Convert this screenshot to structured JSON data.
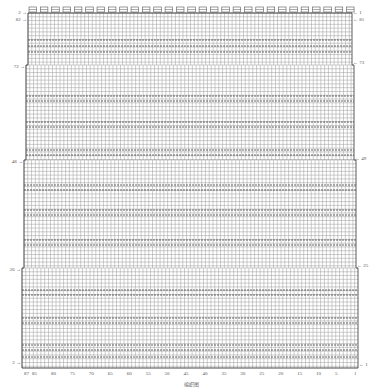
{
  "chart_data": {
    "type": "knitting-chart",
    "title": "",
    "caption": "编织图",
    "stitch_columns": 87,
    "total_rows": 82,
    "top_edge_marker": "knit-purl border pattern",
    "column_labels": [
      "87",
      "85",
      "80",
      "75",
      "70",
      "65",
      "60",
      "55",
      "50",
      "45",
      "40",
      "35",
      "30",
      "25",
      "20",
      "15",
      "10",
      "5",
      "1"
    ],
    "left_row_labels": [
      {
        "label": "2",
        "y": 12
      },
      {
        "label": "82",
        "y": 19
      },
      {
        "label": "72",
        "y": 66
      },
      {
        "label": "48",
        "y": 161
      },
      {
        "label": "26",
        "y": 269
      },
      {
        "label": "2",
        "y": 362
      }
    ],
    "right_row_labels": [
      {
        "label": "1",
        "y": 12
      },
      {
        "label": "81",
        "y": 19
      },
      {
        "label": "73",
        "y": 62
      },
      {
        "label": "49",
        "y": 158
      },
      {
        "label": "25",
        "y": 265
      },
      {
        "label": "1",
        "y": 364
      }
    ],
    "sections": [
      {
        "name": "top",
        "x0": 28,
        "x1": 352,
        "y0": 13,
        "y1": 65
      },
      {
        "name": "upper",
        "x0": 26,
        "x1": 354,
        "y0": 65,
        "y1": 160
      },
      {
        "name": "middle",
        "x0": 24,
        "x1": 356,
        "y0": 160,
        "y1": 268
      },
      {
        "name": "lower",
        "x0": 22,
        "x1": 358,
        "y0": 268,
        "y1": 368
      }
    ],
    "band_rows_y": [
      40,
      46,
      52,
      96,
      101,
      122,
      127,
      150,
      155,
      185,
      190,
      210,
      215,
      240,
      245,
      290,
      295,
      318,
      323,
      345,
      350,
      357
    ],
    "colors": {
      "grid": "#9a9a9a",
      "band": "#555555",
      "edge": "#333333",
      "label": "#555555"
    }
  }
}
